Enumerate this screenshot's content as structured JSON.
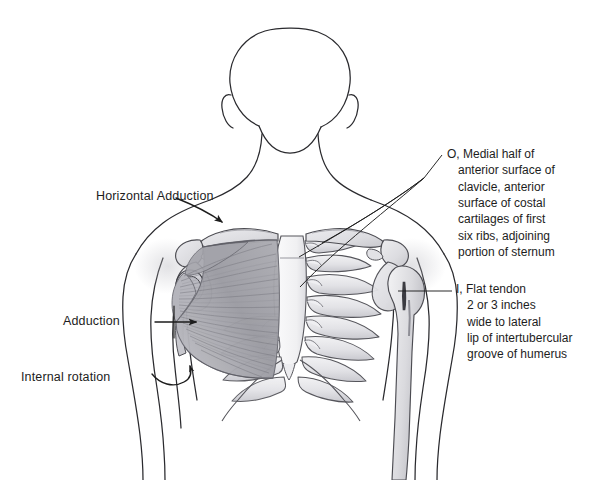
{
  "figure": {
    "background_color": "#ffffff",
    "ink_color": "#1d1d1d",
    "muscle_shade": "#9a9aa0",
    "bone_shade": "#d9d9dc"
  },
  "motion_labels": [
    {
      "id": "horizontal-adduction",
      "text": "Horizontal Adduction"
    },
    {
      "id": "adduction",
      "text": "Adduction"
    },
    {
      "id": "internal-rotation",
      "text": "Internal rotation"
    }
  ],
  "annotations": {
    "origin": {
      "marker": "O,",
      "lines": [
        "O, Medial half of",
        "anterior surface of",
        "clavicle, anterior",
        "surface of costal",
        "cartilages of first",
        "six ribs, adjoining",
        "portion of sternum"
      ]
    },
    "insertion": {
      "marker": "I,",
      "lines": [
        "I, Flat tendon",
        "2 or 3 inches",
        "wide to lateral",
        "lip of intertubercular",
        "groove of humerus"
      ]
    }
  }
}
